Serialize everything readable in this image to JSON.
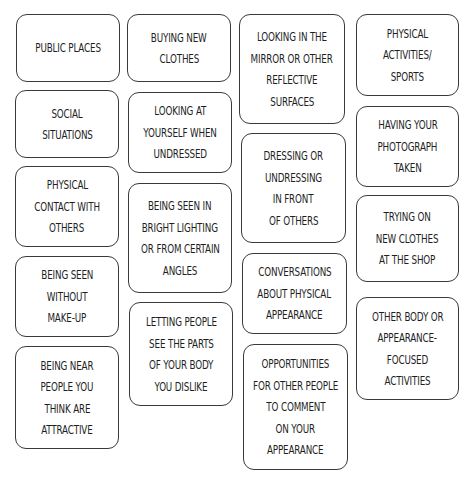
{
  "cards": [
    {
      "id": "public-places",
      "lines": [
        "PUBLIC PLACES"
      ],
      "box": [
        16,
        14,
        104,
        68
      ]
    },
    {
      "id": "buying-new-clothes",
      "lines": [
        "BUYING NEW",
        "CLOTHES"
      ],
      "box": [
        127,
        14,
        104,
        68
      ]
    },
    {
      "id": "looking-in-mirror",
      "lines": [
        "LOOKING IN THE",
        "MIRROR OR OTHER",
        "REFLECTIVE",
        "SURFACES"
      ],
      "box": [
        239,
        14,
        106,
        110
      ]
    },
    {
      "id": "physical-activities",
      "lines": [
        "PHYSICAL",
        "ACTIVITIES/",
        "SPORTS"
      ],
      "box": [
        356,
        14,
        103,
        82
      ]
    },
    {
      "id": "social-situations",
      "lines": [
        "SOCIAL",
        "SITUATIONS"
      ],
      "box": [
        15,
        90,
        104,
        68
      ]
    },
    {
      "id": "looking-undressed",
      "lines": [
        "LOOKING AT",
        "YOURSELF WHEN",
        "UNDRESSED"
      ],
      "box": [
        128,
        92,
        104,
        81
      ]
    },
    {
      "id": "dressing-in-front",
      "lines": [
        "DRESSING OR",
        "UNDRESSING",
        "IN FRONT",
        "OF OTHERS"
      ],
      "box": [
        241,
        133,
        105,
        110
      ]
    },
    {
      "id": "photograph-taken",
      "lines": [
        "HAVING YOUR",
        "PHOTOGRAPH",
        "TAKEN"
      ],
      "box": [
        356,
        106,
        103,
        81
      ]
    },
    {
      "id": "physical-contact",
      "lines": [
        "PHYSICAL",
        "CONTACT WITH",
        "OTHERS"
      ],
      "box": [
        15,
        166,
        104,
        81
      ]
    },
    {
      "id": "bright-lighting",
      "lines": [
        "BEING SEEN IN",
        "BRIGHT LIGHTING",
        "OR FROM CERTAIN",
        "ANGLES"
      ],
      "box": [
        128,
        183,
        104,
        110
      ]
    },
    {
      "id": "trying-on-clothes",
      "lines": [
        "TRYING ON",
        "NEW CLOTHES",
        "AT THE SHOP"
      ],
      "box": [
        356,
        195,
        103,
        87
      ]
    },
    {
      "id": "without-makeup",
      "lines": [
        "BEING SEEN",
        "WITHOUT",
        "MAKE-UP"
      ],
      "box": [
        15,
        256,
        104,
        81
      ]
    },
    {
      "id": "conversations-appearance",
      "lines": [
        "CONVERSATIONS",
        "ABOUT PHYSICAL",
        "APPEARANCE"
      ],
      "box": [
        242,
        253,
        105,
        81
      ]
    },
    {
      "id": "other-body-activities",
      "lines": [
        "OTHER BODY OR",
        "APPEARANCE-",
        "FOCUSED",
        "ACTIVITIES"
      ],
      "box": [
        356,
        297,
        103,
        103
      ]
    },
    {
      "id": "parts-you-dislike",
      "lines": [
        "LETTING PEOPLE",
        "SEE THE PARTS",
        "OF YOUR BODY",
        "YOU DISLIKE"
      ],
      "box": [
        129,
        302,
        104,
        104
      ]
    },
    {
      "id": "near-attractive-people",
      "lines": [
        "BEING NEAR",
        "PEOPLE YOU",
        "THINK ARE",
        "ATTRACTIVE"
      ],
      "box": [
        15,
        346,
        104,
        103
      ]
    },
    {
      "id": "opportunities-comment",
      "lines": [
        "OPPORTUNITIES",
        "FOR OTHER PEOPLE",
        "TO COMMENT",
        "ON YOUR",
        "APPEARANCE"
      ],
      "box": [
        243,
        344,
        105,
        126
      ]
    }
  ],
  "colors": {
    "border": "#3a3a3a",
    "text": "#1e1e1e",
    "background": "#ffffff"
  }
}
